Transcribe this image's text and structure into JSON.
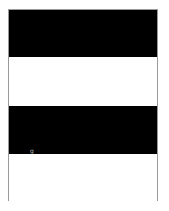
{
  "page": {
    "bands": [
      {
        "color": "#000000"
      },
      {
        "color": "#ffffff"
      },
      {
        "color": "#000000"
      },
      {
        "color": "#ffffff"
      }
    ],
    "mark_text": "g",
    "border_color": "#9a9a9a"
  }
}
